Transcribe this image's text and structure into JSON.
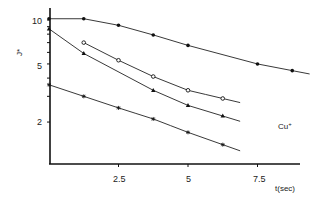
{
  "chart_data": {
    "type": "line",
    "title": "",
    "xlabel": "t(sec)",
    "ylabel": "J*",
    "annotation": "Cu+",
    "y_scale": "log",
    "xlim": [
      0,
      9
    ],
    "ylim": [
      1.1,
      11
    ],
    "x_ticks": [
      2.5,
      5,
      7.5
    ],
    "x_tick_labels": [
      "2.5",
      "5",
      "7.5"
    ],
    "y_ticks": [
      10,
      5,
      2
    ],
    "y_tick_labels": [
      "10",
      "5",
      "2"
    ],
    "grid": false,
    "legend": "none",
    "series": [
      {
        "name": "filled-circle",
        "marker": "filled-circle",
        "x": [
          0,
          1.25,
          2.5,
          3.75,
          5,
          7.5,
          8.75
        ],
        "values": [
          10.2,
          10.2,
          9.2,
          7.9,
          6.7,
          5.0,
          4.5
        ]
      },
      {
        "name": "open-circle",
        "marker": "open-circle",
        "x": [
          1.25,
          2.5,
          3.75,
          5,
          6.25
        ],
        "values": [
          7.0,
          5.3,
          4.1,
          3.3,
          2.9
        ]
      },
      {
        "name": "triangle",
        "marker": "filled-triangle",
        "x": [
          0,
          1.25,
          3.75,
          5,
          6.25
        ],
        "values": [
          8.7,
          5.9,
          3.3,
          2.6,
          2.2
        ]
      },
      {
        "name": "star",
        "marker": "star",
        "x": [
          0,
          1.25,
          2.5,
          3.75,
          5,
          6.25
        ],
        "values": [
          3.6,
          3.0,
          2.5,
          2.1,
          1.7,
          1.4
        ]
      }
    ]
  },
  "labels": {
    "ylabel": "J*",
    "xlabel": "t(sec)",
    "annotation": "Cu",
    "annotation_sup": "+",
    "xtick_0": "2.5",
    "xtick_1": "5",
    "xtick_2": "7.5",
    "ytick_0": "10",
    "ytick_1": "5",
    "ytick_2": "2"
  }
}
